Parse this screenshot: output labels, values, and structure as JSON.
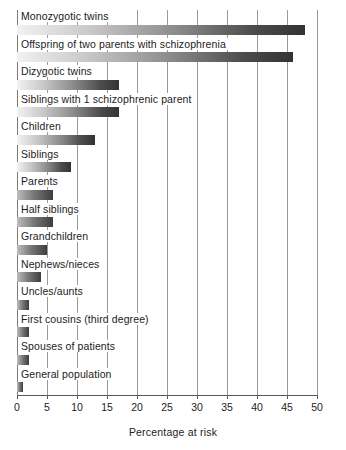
{
  "chart_data": {
    "type": "bar",
    "orientation": "horizontal",
    "title": "",
    "xlabel": "Percentage at risk",
    "ylabel": "",
    "xlim": [
      0,
      50
    ],
    "ylim": null,
    "grid": true,
    "legend": null,
    "xticks": [
      0,
      5,
      10,
      15,
      20,
      25,
      30,
      35,
      40,
      45,
      50
    ],
    "xtick_labels": [
      "0",
      "5",
      "10",
      "15",
      "20",
      "25",
      "30",
      "35",
      "40",
      "45",
      "50"
    ],
    "categories": [
      "Monozygotic twins",
      "Offspring of two parents with schizophrenia",
      "Dizygotic twins",
      "Siblings with 1 schizophrenic parent",
      "Children",
      "Siblings",
      "Parents",
      "Half siblings",
      "Grandchildren",
      "Nephews/nieces",
      "Uncles/aunts",
      "First cousins (third degree)",
      "Spouses of patients",
      "General population"
    ],
    "values": [
      48,
      46,
      17,
      17,
      13,
      9,
      6,
      6,
      5,
      4,
      2,
      2,
      2,
      1
    ]
  },
  "axis": {
    "x_title": "Percentage at risk"
  }
}
